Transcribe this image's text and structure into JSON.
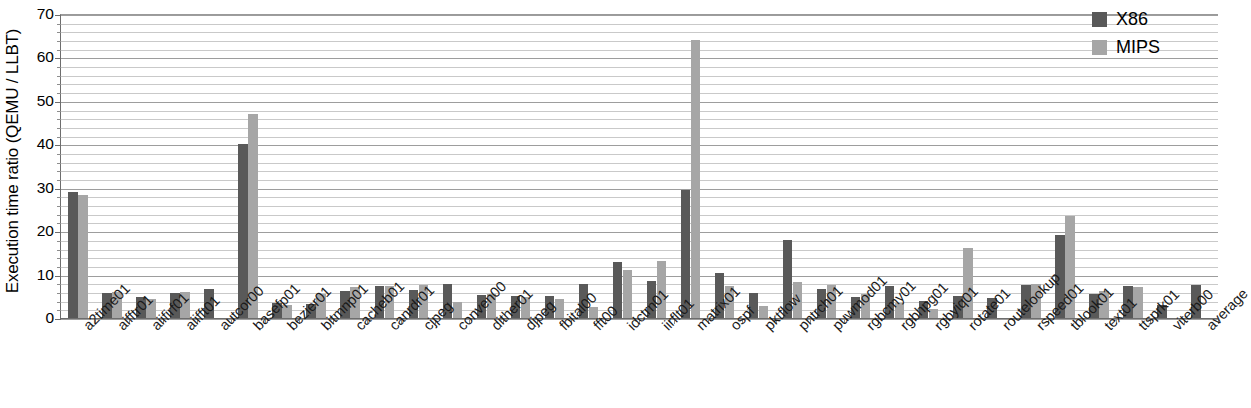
{
  "chart_data": {
    "type": "bar",
    "title": "",
    "xlabel": "",
    "ylabel": "Execution time ratio (QEMU / LLBT)",
    "ylim": [
      0,
      70
    ],
    "ytick_step": 10,
    "yticks": [
      0,
      10,
      20,
      30,
      40,
      50,
      60,
      70
    ],
    "minor_gridlines": true,
    "minor_tick_step": 2,
    "grid": true,
    "legend_position": "top-right",
    "categories": [
      "a2time01",
      "aifftr01",
      "aiifirf01",
      "aiifft01",
      "autcor00",
      "basefp01",
      "bezier01",
      "bitmnp01",
      "cacheb01",
      "canrdr01",
      "cjpeg",
      "conven00",
      "dither01",
      "djpeg",
      "fbital00",
      "fft00",
      "idctrn01",
      "iirflt01",
      "matrix01",
      "ospf",
      "pktflow",
      "pntrch01",
      "puwmod01",
      "rgbcmy01",
      "rgbhpg01",
      "rgbyiq01",
      "rotate01",
      "routelookup",
      "rspeed01",
      "tblook01",
      "text01",
      "ttsprk01",
      "viterb00",
      "average"
    ],
    "series": [
      {
        "name": "X86",
        "color": "#595959",
        "values": [
          29.2,
          6.0,
          5.0,
          6.0,
          6.8,
          40.3,
          3.8,
          3.5,
          6.5,
          7.6,
          6.7,
          8.0,
          5.5,
          5.3,
          5.2,
          8.0,
          13.2,
          8.7,
          29.7,
          10.5,
          6.0,
          18.2,
          6.8,
          5.0,
          7.5,
          4.2,
          5.2,
          4.8,
          7.8,
          19.3,
          5.8,
          7.5,
          3.2,
          7.8
        ]
      },
      {
        "name": "MIPS",
        "color": "#a6a6a6",
        "values": [
          28.5,
          6.2,
          4.7,
          6.2,
          0.0,
          47.3,
          3.2,
          5.8,
          7.3,
          7.6,
          7.8,
          4.0,
          5.8,
          5.0,
          4.5,
          2.8,
          11.2,
          13.3,
          64.2,
          7.5,
          3.0,
          8.5,
          7.8,
          5.8,
          3.8,
          2.2,
          16.3,
          0.0,
          8.0,
          23.8,
          6.5,
          7.3,
          0.0,
          0.0
        ]
      }
    ]
  },
  "legend": {
    "entries": [
      {
        "label": "X86",
        "swatch": "x86"
      },
      {
        "label": "MIPS",
        "swatch": "mips"
      }
    ]
  }
}
